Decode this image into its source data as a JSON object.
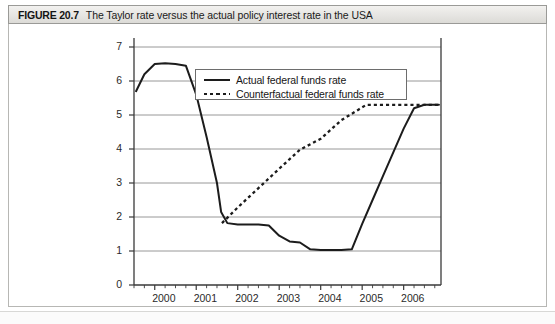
{
  "figure": {
    "label": "FIGURE 20.7",
    "caption": "The Taylor rate versus the actual policy interest rate in the USA"
  },
  "legend": {
    "position": "inside-top-center",
    "entries": [
      {
        "label": "Actual federal funds rate",
        "style": "solid"
      },
      {
        "label": "Counterfactual federal funds rate",
        "style": "dotted"
      }
    ]
  },
  "chart_data": {
    "type": "line",
    "title": "The Taylor rate versus the actual policy interest rate in the USA",
    "xlabel": "",
    "ylabel": "",
    "xlim": [
      1999.5,
      2006.9
    ],
    "ylim": [
      0,
      7
    ],
    "grid": true,
    "grid_axis": "y",
    "legend_position": "inside-top-center",
    "ytick_labels": [
      "0",
      "1",
      "2",
      "3",
      "4",
      "5",
      "6",
      "7"
    ],
    "yticks": [
      0,
      1,
      2,
      3,
      4,
      5,
      6,
      7
    ],
    "xtick_labels": [
      "2000",
      "2001",
      "2002",
      "2003",
      "2004",
      "2005",
      "2006"
    ],
    "xticks": [
      2000,
      2001,
      2002,
      2003,
      2004,
      2005,
      2006
    ],
    "minor_xtick_interval": 0.25,
    "series": [
      {
        "name": "Actual federal funds rate",
        "style": "solid",
        "color": "#1c1c1c",
        "x": [
          1999.55,
          1999.75,
          2000.0,
          2000.25,
          2000.5,
          2000.75,
          2001.0,
          2001.25,
          2001.5,
          2001.6,
          2001.75,
          2002.0,
          2002.25,
          2002.5,
          2002.75,
          2003.0,
          2003.25,
          2003.5,
          2003.75,
          2004.0,
          2004.25,
          2004.5,
          2004.75,
          2005.0,
          2005.25,
          2005.5,
          2005.75,
          2006.0,
          2006.25,
          2006.5,
          2006.85
        ],
        "y": [
          5.7,
          6.2,
          6.5,
          6.52,
          6.5,
          6.45,
          5.6,
          4.35,
          3.0,
          2.15,
          1.82,
          1.78,
          1.78,
          1.78,
          1.75,
          1.45,
          1.28,
          1.25,
          1.05,
          1.03,
          1.03,
          1.03,
          1.05,
          1.8,
          2.5,
          3.2,
          3.9,
          4.6,
          5.2,
          5.3,
          5.3
        ]
      },
      {
        "name": "Counterfactual federal funds rate",
        "style": "dotted",
        "color": "#1c1c1c",
        "x": [
          2001.62,
          2002.0,
          2002.5,
          2003.0,
          2003.5,
          2004.0,
          2004.5,
          2004.9,
          2005.1,
          2005.5,
          2006.0,
          2006.5,
          2006.85
        ],
        "y": [
          1.82,
          2.28,
          2.85,
          3.42,
          3.98,
          4.3,
          4.85,
          5.15,
          5.3,
          5.3,
          5.3,
          5.3,
          5.3
        ]
      }
    ],
    "annotations": []
  }
}
